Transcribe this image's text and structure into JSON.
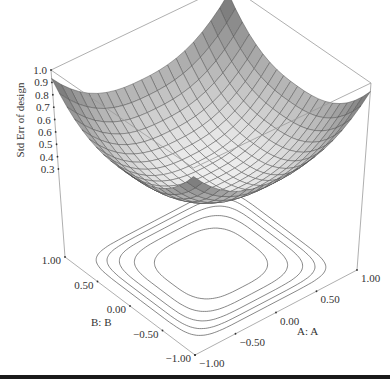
{
  "chart_data": {
    "type": "surface3d",
    "title": "",
    "zlabel": "Std Err of design",
    "xlabel": "A: A",
    "ylabel": "B: B",
    "z_ticks": [
      "1.0",
      "0.9",
      "0.8",
      "0.7",
      "0.6",
      "0.6",
      "0.5",
      "0.4",
      "0.3"
    ],
    "x_ticks": [
      "-1.00",
      "-0.50",
      "0.00",
      "0.50",
      "1.00"
    ],
    "y_ticks": [
      "-1.00",
      "-0.50",
      "0.00",
      "0.50",
      "1.00"
    ],
    "x_range": [
      -1,
      1
    ],
    "y_range": [
      -1,
      1
    ],
    "z_range": [
      0.3,
      1.0
    ],
    "grid_cells": 20,
    "corner_values": {
      "A-1_B-1": 0.9,
      "A-1_B1": 0.9,
      "A1_B-1": 0.9,
      "A1_B1": 0.9
    },
    "center_value": 0.32,
    "contour_levels": [
      "inner",
      "mid",
      "mid2",
      "outer",
      "outer2"
    ],
    "surface_color": "#8c8c8c",
    "contour_color": "#555555"
  },
  "figure": {
    "bottom_rule": true
  }
}
